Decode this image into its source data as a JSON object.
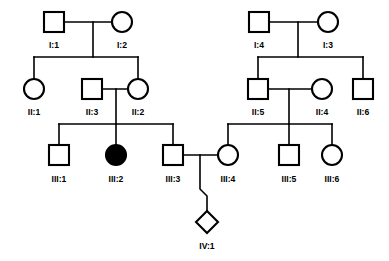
{
  "chart_data": {
    "type": "diagram",
    "diagram_type": "pedigree",
    "title": "",
    "legend": {
      "square": "male",
      "circle": "female",
      "diamond": "unknown sex",
      "filled": "affected",
      "unfilled": "unaffected"
    },
    "generations": [
      "I",
      "II",
      "III",
      "IV"
    ],
    "individuals": [
      {
        "id": "I:1",
        "label": "I:1",
        "sex": "male",
        "shape": "square",
        "affected": false,
        "generation": "I",
        "x": 54,
        "y": 22,
        "label_x": 54,
        "label_y": 48
      },
      {
        "id": "I:2",
        "label": "I:2",
        "sex": "female",
        "shape": "circle",
        "affected": false,
        "generation": "I",
        "x": 122,
        "y": 22,
        "label_x": 122,
        "label_y": 48
      },
      {
        "id": "I:4",
        "label": "I:4",
        "sex": "male",
        "shape": "square",
        "affected": false,
        "generation": "I",
        "x": 259,
        "y": 22,
        "label_x": 259,
        "label_y": 48
      },
      {
        "id": "I:3",
        "label": "I:3",
        "sex": "female",
        "shape": "circle",
        "affected": false,
        "generation": "I",
        "x": 328,
        "y": 22,
        "label_x": 328,
        "label_y": 48
      },
      {
        "id": "II:1",
        "label": "II:1",
        "sex": "female",
        "shape": "circle",
        "affected": false,
        "generation": "II",
        "x": 34,
        "y": 89,
        "label_x": 34,
        "label_y": 115
      },
      {
        "id": "II:3",
        "label": "II:3",
        "sex": "male",
        "shape": "square",
        "affected": false,
        "generation": "II",
        "x": 92,
        "y": 89,
        "label_x": 92,
        "label_y": 115
      },
      {
        "id": "II:2",
        "label": "II:2",
        "sex": "female",
        "shape": "circle",
        "affected": false,
        "generation": "II",
        "x": 138,
        "y": 89,
        "label_x": 138,
        "label_y": 115
      },
      {
        "id": "II:5",
        "label": "II:5",
        "sex": "male",
        "shape": "square",
        "affected": false,
        "generation": "II",
        "x": 258,
        "y": 89,
        "label_x": 258,
        "label_y": 115
      },
      {
        "id": "II:4",
        "label": "II:4",
        "sex": "female",
        "shape": "circle",
        "affected": false,
        "generation": "II",
        "x": 322,
        "y": 89,
        "label_x": 322,
        "label_y": 115
      },
      {
        "id": "II:6",
        "label": "II:6",
        "sex": "male",
        "shape": "square",
        "affected": false,
        "generation": "II",
        "x": 363,
        "y": 89,
        "label_x": 363,
        "label_y": 115
      },
      {
        "id": "III:1",
        "label": "III:1",
        "sex": "male",
        "shape": "square",
        "affected": false,
        "generation": "III",
        "x": 59,
        "y": 155,
        "label_x": 59,
        "label_y": 182
      },
      {
        "id": "III:2",
        "label": "III:2",
        "sex": "female",
        "shape": "circle",
        "affected": true,
        "generation": "III",
        "x": 116,
        "y": 155,
        "label_x": 116,
        "label_y": 182
      },
      {
        "id": "III:3",
        "label": "III:3",
        "sex": "male",
        "shape": "square",
        "affected": false,
        "generation": "III",
        "x": 173,
        "y": 155,
        "label_x": 173,
        "label_y": 182
      },
      {
        "id": "III:4",
        "label": "III:4",
        "sex": "female",
        "shape": "circle",
        "affected": false,
        "generation": "III",
        "x": 228,
        "y": 155,
        "label_x": 228,
        "label_y": 182
      },
      {
        "id": "III:5",
        "label": "III:5",
        "sex": "male",
        "shape": "square",
        "affected": false,
        "generation": "III",
        "x": 289,
        "y": 155,
        "label_x": 289,
        "label_y": 182
      },
      {
        "id": "III:6",
        "label": "III:6",
        "sex": "female",
        "shape": "circle",
        "affected": false,
        "generation": "III",
        "x": 332,
        "y": 155,
        "label_x": 332,
        "label_y": 182
      },
      {
        "id": "IV:1",
        "label": "IV:1",
        "sex": "unknown",
        "shape": "diamond",
        "affected": false,
        "generation": "IV",
        "x": 207,
        "y": 222,
        "label_x": 207,
        "label_y": 249
      }
    ],
    "matings": [
      {
        "partners": [
          "I:1",
          "I:2"
        ],
        "children": [
          "II:1",
          "II:2"
        ]
      },
      {
        "partners": [
          "I:4",
          "I:3"
        ],
        "children": [
          "II:5",
          "II:6"
        ]
      },
      {
        "partners": [
          "II:3",
          "II:2"
        ],
        "children": [
          "III:1",
          "III:2",
          "III:3"
        ]
      },
      {
        "partners": [
          "II:5",
          "II:4"
        ],
        "children": [
          "III:4",
          "III:5",
          "III:6"
        ]
      },
      {
        "partners": [
          "III:3",
          "III:4"
        ],
        "children": [
          "IV:1"
        ]
      }
    ],
    "affected_individuals": [
      "III:2"
    ],
    "colors": {
      "line": "#000000",
      "symbol_stroke": "#000000",
      "symbol_fill_unaffected": "#ffffff",
      "symbol_fill_affected": "#000000",
      "background": "#ffffff"
    },
    "connector_paths": [
      {
        "name": "mating-I1-I2",
        "d": "M 64 22 L 122 22"
      },
      {
        "name": "descent-I1-I2",
        "d": "M 93 22 L 93 57"
      },
      {
        "name": "sibship-gen2-left",
        "d": "M 34 57 L 138 57"
      },
      {
        "name": "drop-II1",
        "d": "M 34 57 L 34 80"
      },
      {
        "name": "drop-II2",
        "d": "M 138 57 L 138 80"
      },
      {
        "name": "mating-I4-I3",
        "d": "M 269 22 L 328 22"
      },
      {
        "name": "descent-I4-I3",
        "d": "M 298 22 L 298 57"
      },
      {
        "name": "sibship-gen2-right",
        "d": "M 258 57 L 363 57"
      },
      {
        "name": "drop-II5",
        "d": "M 258 57 L 258 80"
      },
      {
        "name": "drop-II6",
        "d": "M 363 57 L 363 80"
      },
      {
        "name": "mating-II3-II2",
        "d": "M 102 89 L 138 89"
      },
      {
        "name": "descent-II3-II2",
        "d": "M 116 89 L 116 124"
      },
      {
        "name": "sibship-gen3-left",
        "d": "M 59 124 L 173 124"
      },
      {
        "name": "drop-III1",
        "d": "M 59 124 L 59 146"
      },
      {
        "name": "drop-III2",
        "d": "M 116 124 L 116 146"
      },
      {
        "name": "drop-III3",
        "d": "M 173 124 L 173 146"
      },
      {
        "name": "mating-II5-II4",
        "d": "M 268 89 L 322 89"
      },
      {
        "name": "descent-II5-II4",
        "d": "M 289 89 L 289 124"
      },
      {
        "name": "sibship-gen3-right",
        "d": "M 228 124 L 332 124"
      },
      {
        "name": "drop-III4",
        "d": "M 228 124 L 228 146"
      },
      {
        "name": "drop-III5",
        "d": "M 289 124 L 289 146"
      },
      {
        "name": "drop-III6",
        "d": "M 332 124 L 332 146"
      },
      {
        "name": "mating-III3-III4",
        "d": "M 183 155 L 228 155"
      },
      {
        "name": "descent-to-IV1",
        "d": "M 200 155 L 200 189 L 207 196 L 207 213"
      }
    ]
  }
}
